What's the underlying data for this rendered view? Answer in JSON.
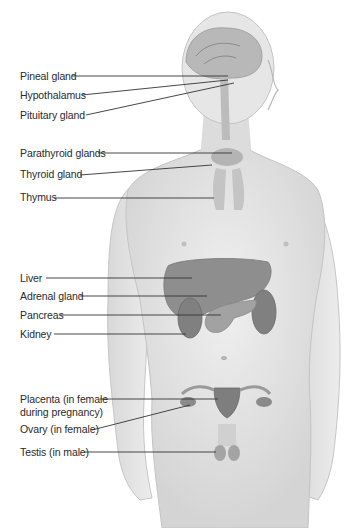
{
  "diagram": {
    "labels": [
      {
        "id": "pineal",
        "text": "Pineal gland",
        "x": 20,
        "y": 70,
        "line": [
          72,
          76,
          228,
          76
        ]
      },
      {
        "id": "hypothalamus",
        "text": "Hypothalamus",
        "x": 20,
        "y": 89,
        "line": [
          82,
          95,
          228,
          80
        ]
      },
      {
        "id": "pituitary",
        "text": "Pituitary gland",
        "x": 20,
        "y": 109,
        "line": [
          86,
          115,
          234,
          83
        ]
      },
      {
        "id": "parathyroid",
        "text": "Parathyroid glands",
        "x": 20,
        "y": 147,
        "line": [
          98,
          153,
          232,
          153
        ]
      },
      {
        "id": "thyroid",
        "text": "Thyroid gland",
        "x": 20,
        "y": 168,
        "line": [
          80,
          175,
          212,
          165
        ]
      },
      {
        "id": "thymus",
        "text": "Thymus",
        "x": 20,
        "y": 191,
        "line": [
          54,
          198,
          214,
          198
        ]
      },
      {
        "id": "liver",
        "text": "Liver",
        "x": 20,
        "y": 272,
        "line": [
          46,
          278,
          192,
          278
        ]
      },
      {
        "id": "adrenal",
        "text": "Adrenal gland",
        "x": 20,
        "y": 290,
        "line": [
          80,
          296,
          207,
          296
        ]
      },
      {
        "id": "pancreas",
        "text": "Pancreas",
        "x": 20,
        "y": 309,
        "line": [
          60,
          315,
          221,
          315
        ]
      },
      {
        "id": "kidney",
        "text": "Kidney",
        "x": 20,
        "y": 328,
        "line": [
          54,
          334,
          186,
          334
        ]
      },
      {
        "id": "placenta",
        "text": "Placenta (in female",
        "text2": "during pregnancy)",
        "x": 20,
        "y": 393,
        "line": [
          100,
          399,
          218,
          399
        ]
      },
      {
        "id": "ovary",
        "text": "Ovary (in female)",
        "x": 20,
        "y": 423,
        "line": [
          92,
          430,
          190,
          405
        ]
      },
      {
        "id": "testis",
        "text": "Testis (in male)",
        "x": 20,
        "y": 446,
        "line": [
          84,
          452,
          216,
          452
        ]
      }
    ]
  },
  "colors": {
    "skin": "#e4e4e4",
    "skin_shade": "#cfcfcf",
    "organ": "#8f8f8f",
    "organ_dark": "#6e6e6e",
    "line": "#333333"
  }
}
